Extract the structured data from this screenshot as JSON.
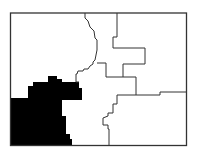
{
  "map": {
    "type": "district-map",
    "colors": {
      "background": "#ffffff",
      "border": "#333333",
      "highlight": "#000000"
    },
    "districts": [
      {
        "id": "district-northwest",
        "highlighted": false
      },
      {
        "id": "district-north-central",
        "highlighted": false
      },
      {
        "id": "district-northeast",
        "highlighted": false
      },
      {
        "id": "district-central",
        "highlighted": false
      },
      {
        "id": "district-southeast",
        "highlighted": false
      },
      {
        "id": "district-southwest",
        "highlighted": true
      }
    ]
  }
}
